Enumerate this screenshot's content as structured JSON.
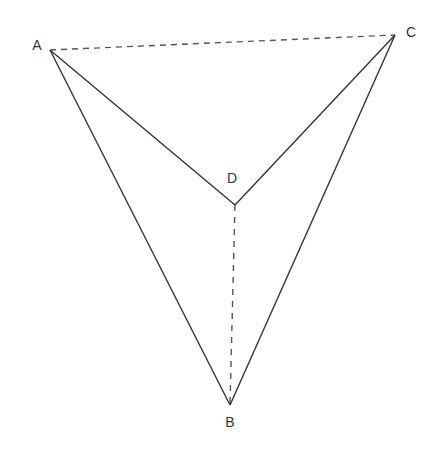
{
  "diagram": {
    "type": "geometry-tetrahedron-net",
    "colors": {
      "line": "#333333",
      "label": "#333333",
      "background": "#ffffff"
    },
    "points": [
      {
        "name": "A",
        "x": 50,
        "y": 50,
        "label_x": 37,
        "label_y": 50
      },
      {
        "name": "C",
        "x": 395,
        "y": 35,
        "label_x": 411,
        "label_y": 37
      },
      {
        "name": "D",
        "x": 235,
        "y": 205,
        "label_x": 232,
        "label_y": 183
      },
      {
        "name": "B",
        "x": 230,
        "y": 405,
        "label_x": 230,
        "label_y": 427
      }
    ],
    "labels": {
      "A": "A",
      "B": "B",
      "C": "C",
      "D": "D"
    },
    "solid_segments": [
      "AB",
      "AD",
      "CD",
      "CB"
    ],
    "dashed_segments": [
      "AC",
      "DB"
    ]
  }
}
